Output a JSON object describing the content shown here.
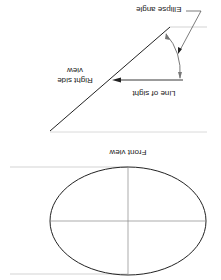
{
  "figure": {
    "orientation": "rotated 180 degrees",
    "labels": {
      "ellipse_angle": "Ellipse angle",
      "line_of_sight": "Line of sight",
      "right_side_view_line1": "Right side",
      "right_side_view_line2": "view",
      "front_view": "Front view"
    },
    "colors": {
      "object_line": "#222222",
      "projection_line": "#c8c8c8",
      "center_line": "#888888",
      "background": "#ffffff"
    }
  }
}
